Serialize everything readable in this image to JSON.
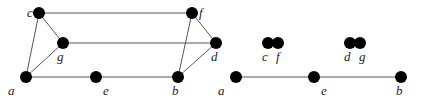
{
  "diagram": {
    "type": "graph",
    "graphs": [
      {
        "name": "original-graph",
        "nodes": [
          {
            "id": "c",
            "label": "c",
            "x": 39,
            "y": 13,
            "lx": 27,
            "ly": 17
          },
          {
            "id": "f",
            "label": "f",
            "x": 192,
            "y": 13,
            "lx": 199,
            "ly": 17
          },
          {
            "id": "g",
            "label": "g",
            "x": 63,
            "y": 43,
            "lx": 57,
            "ly": 61
          },
          {
            "id": "d",
            "label": "d",
            "x": 216,
            "y": 43,
            "lx": 211,
            "ly": 61
          },
          {
            "id": "a",
            "label": "a",
            "x": 26,
            "y": 77,
            "lx": 8,
            "ly": 95
          },
          {
            "id": "e",
            "label": "e",
            "x": 96,
            "y": 77,
            "lx": 103,
            "ly": 95
          },
          {
            "id": "b",
            "label": "b",
            "x": 178,
            "y": 77,
            "lx": 172,
            "ly": 95
          }
        ],
        "edges": [
          [
            "c",
            "f"
          ],
          [
            "c",
            "g"
          ],
          [
            "c",
            "a"
          ],
          [
            "g",
            "a"
          ],
          [
            "g",
            "d"
          ],
          [
            "a",
            "e"
          ],
          [
            "e",
            "b"
          ],
          [
            "f",
            "d"
          ],
          [
            "f",
            "b"
          ],
          [
            "d",
            "b"
          ]
        ]
      },
      {
        "name": "contracted-graph",
        "nodes": [
          {
            "id": "a2",
            "label": "a",
            "x": 236,
            "y": 77,
            "lx": 218,
            "ly": 95
          },
          {
            "id": "c2",
            "label": "c",
            "x": 268,
            "y": 43,
            "lx": 262,
            "ly": 61
          },
          {
            "id": "f2",
            "label": "f",
            "x": 278,
            "y": 43,
            "lx": 276,
            "ly": 61
          },
          {
            "id": "d2",
            "label": "d",
            "x": 350,
            "y": 43,
            "lx": 344,
            "ly": 61
          },
          {
            "id": "g2",
            "label": "g",
            "x": 360,
            "y": 43,
            "lx": 359,
            "ly": 61
          },
          {
            "id": "e2",
            "label": "e",
            "x": 314,
            "y": 77,
            "lx": 321,
            "ly": 95
          },
          {
            "id": "b2",
            "label": "b",
            "x": 401,
            "y": 77,
            "lx": 396,
            "ly": 95
          }
        ],
        "edges": [
          [
            "a2",
            "e2"
          ],
          [
            "e2",
            "b2"
          ]
        ]
      }
    ],
    "node_radius": 6,
    "colors": {
      "node": "#000000",
      "edge": "#555555",
      "label": "#222222"
    }
  }
}
